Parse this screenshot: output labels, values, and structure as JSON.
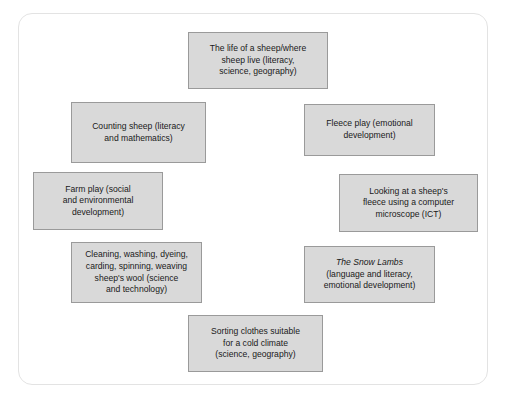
{
  "diagram": {
    "type": "topic-web",
    "title": "",
    "panel": {
      "background_color": "#ffffff",
      "border_color": "#e3e3e3"
    },
    "node_style": {
      "fill_color": "#d9d9d9",
      "border_color": "#9a9a9a",
      "text_color": "#1a1a1a"
    },
    "nodes": [
      {
        "id": "life-of-a-sheep",
        "lines": [
          "The life of a sheep/where",
          "sheep live (literacy,",
          "science, geography)"
        ]
      },
      {
        "id": "counting-sheep",
        "lines": [
          "Counting sheep (literacy",
          "and mathematics)"
        ]
      },
      {
        "id": "fleece-play",
        "lines": [
          "Fleece play (emotional",
          "development)"
        ]
      },
      {
        "id": "farm-play",
        "lines": [
          "Farm play (social",
          "and environmental",
          "development)"
        ]
      },
      {
        "id": "computer-microscope",
        "lines": [
          "Looking at a sheep's",
          "fleece using a computer",
          "microscope (ICT)"
        ]
      },
      {
        "id": "wool-processing",
        "lines": [
          "Cleaning, washing, dyeing,",
          "carding, spinning, weaving",
          "sheep's wool (science",
          "and technology)"
        ]
      },
      {
        "id": "the-snow-lambs",
        "lines": [
          "The Snow Lambs",
          "(language and literacy,",
          "emotional development)"
        ],
        "italic_lines": [
          0
        ]
      },
      {
        "id": "sorting-clothes",
        "lines": [
          "Sorting clothes suitable",
          "for a cold climate",
          "(science, geography)"
        ]
      }
    ]
  },
  "caption": {
    "text": ""
  }
}
